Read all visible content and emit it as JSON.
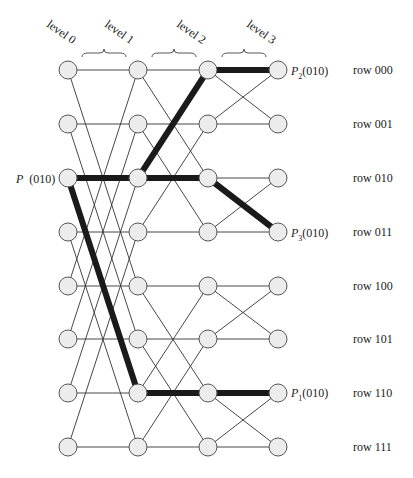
{
  "diagram": {
    "type": "butterfly-network",
    "levels": [
      "level 0",
      "level 1",
      "level 2",
      "level 3"
    ],
    "level_x": [
      68,
      138,
      208,
      278
    ],
    "row_y": [
      70,
      124,
      178,
      232,
      286,
      339,
      393,
      447
    ],
    "rows": [
      "row 000",
      "row 001",
      "row 010",
      "row 011",
      "row 100",
      "row 101",
      "row 110",
      "row 111"
    ],
    "stage_xor": [
      4,
      2,
      1
    ],
    "source_label": {
      "name": "P",
      "addr": "(010)",
      "row": 2,
      "level": 0
    },
    "destination_labels": [
      {
        "name": "P",
        "sub": "2",
        "addr": "(010)",
        "row": 0,
        "level": 3
      },
      {
        "name": "P",
        "sub": "3",
        "addr": "(010)",
        "row": 3,
        "level": 3
      },
      {
        "name": "P",
        "sub": "1",
        "addr": "(010)",
        "row": 6,
        "level": 3
      }
    ],
    "bold_paths": [
      [
        [
          0,
          2
        ],
        [
          1,
          2
        ],
        [
          2,
          0
        ],
        [
          3,
          0
        ]
      ],
      [
        [
          0,
          2
        ],
        [
          1,
          2
        ],
        [
          2,
          2
        ],
        [
          3,
          3
        ]
      ],
      [
        [
          0,
          2
        ],
        [
          1,
          6
        ],
        [
          2,
          6
        ],
        [
          3,
          6
        ]
      ]
    ],
    "colors": {
      "node_fill": "#ececec",
      "node_stroke": "#555555",
      "edge": "#333333",
      "bold": "#1a1a1a"
    }
  }
}
